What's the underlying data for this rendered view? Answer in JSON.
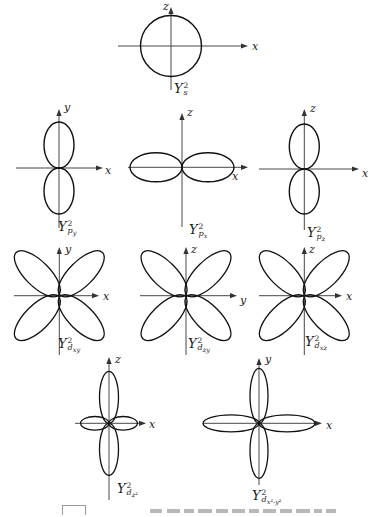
{
  "page": {
    "background": "#ffffff",
    "ink": "#1a1a1a",
    "description_visible_content": "nine orbital angular distribution plots"
  },
  "figures": [
    {
      "id": "s",
      "axis_v": "z",
      "axis_h": "x",
      "label": {
        "base": "Y",
        "sup": "2",
        "sub": "s",
        "subsub": ""
      }
    },
    {
      "id": "py",
      "axis_v": "y",
      "axis_h": "x",
      "label": {
        "base": "Y",
        "sup": "2",
        "sub": "p",
        "subsub": "y"
      }
    },
    {
      "id": "px",
      "axis_v": "z",
      "axis_h": "x",
      "label": {
        "base": "Y",
        "sup": "2",
        "sub": "p",
        "subsub": "x"
      }
    },
    {
      "id": "pz",
      "axis_v": "z",
      "axis_h": "x",
      "label": {
        "base": "Y",
        "sup": "2",
        "sub": "p",
        "subsub": "z"
      }
    },
    {
      "id": "dxy",
      "axis_v": "y",
      "axis_h": "x",
      "label": {
        "base": "Y",
        "sup": "2",
        "sub": "d",
        "subsub": "xy"
      }
    },
    {
      "id": "dzy",
      "axis_v": "z",
      "axis_h": "y",
      "label": {
        "base": "Y",
        "sup": "2",
        "sub": "d",
        "subsub": "zy"
      }
    },
    {
      "id": "dxz",
      "axis_v": "z",
      "axis_h": "x",
      "label": {
        "base": "Y",
        "sup": "2",
        "sub": "d",
        "subsub": "xz"
      }
    },
    {
      "id": "dz2",
      "axis_v": "z",
      "axis_h": "x",
      "label": {
        "base": "Y",
        "sup": "2",
        "sub": "d",
        "subsub": "z²"
      }
    },
    {
      "id": "dx2y2",
      "axis_v": "y",
      "axis_h": "x",
      "label": {
        "base": "Y",
        "sup": "2",
        "sub": "d",
        "subsub": "x²-y²"
      }
    }
  ]
}
